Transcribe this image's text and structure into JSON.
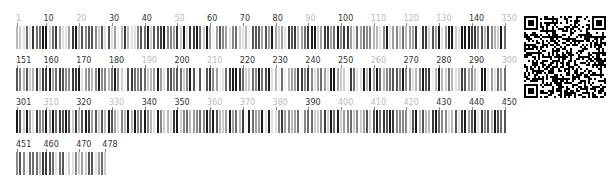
{
  "viewer": {
    "positions_per_row": 150,
    "total_length": 478,
    "px_per_position": 3.273,
    "colors": {
      "dark_label": "#333333",
      "light_label": "#bbbbbb",
      "levels": [
        "#f2f2f2",
        "#e0e0e0",
        "#cccccc",
        "#b8b8b8",
        "#a0a0a0",
        "#888888",
        "#6e6e6e",
        "#555555",
        "#3a3a3a",
        "#1a1a1a"
      ]
    },
    "rows": [
      {
        "start": 1,
        "end": 150,
        "top": 14,
        "labels": [
          {
            "text": "1",
            "pos": 1,
            "dark": false
          },
          {
            "text": "10",
            "pos": 10,
            "dark": true
          },
          {
            "text": "20",
            "pos": 20,
            "dark": false
          },
          {
            "text": "30",
            "pos": 30,
            "dark": true
          },
          {
            "text": "40",
            "pos": 40,
            "dark": true
          },
          {
            "text": "50",
            "pos": 50,
            "dark": false
          },
          {
            "text": "60",
            "pos": 60,
            "dark": true
          },
          {
            "text": "70",
            "pos": 70,
            "dark": true
          },
          {
            "text": "80",
            "pos": 80,
            "dark": true
          },
          {
            "text": "90",
            "pos": 90,
            "dark": false
          },
          {
            "text": "100",
            "pos": 100,
            "dark": true
          },
          {
            "text": "110",
            "pos": 110,
            "dark": false
          },
          {
            "text": "120",
            "pos": 120,
            "dark": false
          },
          {
            "text": "130",
            "pos": 130,
            "dark": false
          },
          {
            "text": "140",
            "pos": 140,
            "dark": true
          },
          {
            "text": "150",
            "pos": 150,
            "dark": false
          }
        ]
      },
      {
        "start": 151,
        "end": 300,
        "top": 56,
        "labels": [
          {
            "text": "151",
            "pos": 151,
            "dark": true
          },
          {
            "text": "160",
            "pos": 160,
            "dark": true
          },
          {
            "text": "170",
            "pos": 170,
            "dark": true
          },
          {
            "text": "180",
            "pos": 180,
            "dark": true
          },
          {
            "text": "190",
            "pos": 190,
            "dark": false
          },
          {
            "text": "200",
            "pos": 200,
            "dark": true
          },
          {
            "text": "210",
            "pos": 210,
            "dark": false
          },
          {
            "text": "220",
            "pos": 220,
            "dark": true
          },
          {
            "text": "230",
            "pos": 230,
            "dark": true
          },
          {
            "text": "240",
            "pos": 240,
            "dark": true
          },
          {
            "text": "250",
            "pos": 250,
            "dark": true
          },
          {
            "text": "260",
            "pos": 260,
            "dark": false
          },
          {
            "text": "270",
            "pos": 270,
            "dark": true
          },
          {
            "text": "280",
            "pos": 280,
            "dark": true
          },
          {
            "text": "290",
            "pos": 290,
            "dark": true
          },
          {
            "text": "300",
            "pos": 300,
            "dark": false
          }
        ]
      },
      {
        "start": 301,
        "end": 450,
        "top": 98,
        "labels": [
          {
            "text": "301",
            "pos": 301,
            "dark": true
          },
          {
            "text": "310",
            "pos": 310,
            "dark": false
          },
          {
            "text": "320",
            "pos": 320,
            "dark": true
          },
          {
            "text": "330",
            "pos": 330,
            "dark": false
          },
          {
            "text": "340",
            "pos": 340,
            "dark": true
          },
          {
            "text": "350",
            "pos": 350,
            "dark": true
          },
          {
            "text": "360",
            "pos": 360,
            "dark": false
          },
          {
            "text": "370",
            "pos": 370,
            "dark": false
          },
          {
            "text": "380",
            "pos": 380,
            "dark": false
          },
          {
            "text": "390",
            "pos": 390,
            "dark": true
          },
          {
            "text": "400",
            "pos": 400,
            "dark": false
          },
          {
            "text": "410",
            "pos": 410,
            "dark": false
          },
          {
            "text": "420",
            "pos": 420,
            "dark": false
          },
          {
            "text": "430",
            "pos": 430,
            "dark": true
          },
          {
            "text": "440",
            "pos": 440,
            "dark": true
          },
          {
            "text": "450",
            "pos": 450,
            "dark": true
          }
        ]
      },
      {
        "start": 451,
        "end": 478,
        "top": 140,
        "labels": [
          {
            "text": "451",
            "pos": 451,
            "dark": true
          },
          {
            "text": "460",
            "pos": 460,
            "dark": true
          },
          {
            "text": "470",
            "pos": 470,
            "dark": true
          },
          {
            "text": "478",
            "pos": 478,
            "dark": true
          }
        ]
      }
    ],
    "intensity_seed": 7919
  },
  "qr_code": {
    "label": "qr-code",
    "modules": 41
  }
}
